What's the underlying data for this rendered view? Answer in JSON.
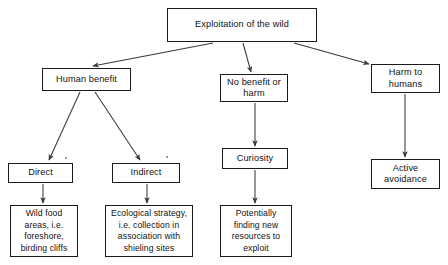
{
  "diagram": {
    "title": "Exploitation of the wild",
    "type": "flowchart",
    "orientation": "top-down",
    "canvas": {
      "width": 448,
      "height": 265,
      "background": "#ffffff"
    },
    "style": {
      "box_border": "#1a1a1a",
      "text_color": "#111111",
      "edge_color": "#3a3a3a"
    },
    "nodes": [
      {
        "id": "root",
        "label": "Exploitation of the wild",
        "level": 0
      },
      {
        "id": "human",
        "label": "Human benefit",
        "level": 1
      },
      {
        "id": "nobenefit",
        "label": "No benefit or\nharm",
        "level": 1
      },
      {
        "id": "harm",
        "label": "Harm to\nhumans",
        "level": 1
      },
      {
        "id": "direct",
        "label": "Direct",
        "level": 2
      },
      {
        "id": "indirect",
        "label": "Indirect",
        "level": 2
      },
      {
        "id": "curiosity",
        "label": "Curiosity",
        "level": 2
      },
      {
        "id": "active",
        "label": "Active\navoidance",
        "level": 2
      },
      {
        "id": "wild",
        "label": "Wild food\nareas, i.e.\nforeshore,\nbirding cliffs",
        "level": 3
      },
      {
        "id": "ecology",
        "label": "Ecological strategy,\ni.e. collection in\nassociation with\nshieling sites",
        "level": 3
      },
      {
        "id": "potential",
        "label": "Potentially\nfinding new\nresources to\nexploit",
        "level": 3
      }
    ],
    "edges": [
      {
        "from": "root",
        "to": "human",
        "arrow": true
      },
      {
        "from": "root",
        "to": "nobenefit",
        "arrow": true
      },
      {
        "from": "root",
        "to": "harm",
        "arrow": true
      },
      {
        "from": "human",
        "to": "direct",
        "arrow": true
      },
      {
        "from": "human",
        "to": "indirect",
        "arrow": true
      },
      {
        "from": "nobenefit",
        "to": "curiosity",
        "arrow": true
      },
      {
        "from": "harm",
        "to": "active",
        "arrow": true
      },
      {
        "from": "direct",
        "to": "wild",
        "arrow": true
      },
      {
        "from": "indirect",
        "to": "ecology",
        "arrow": true
      },
      {
        "from": "curiosity",
        "to": "potential",
        "arrow": true
      }
    ]
  }
}
